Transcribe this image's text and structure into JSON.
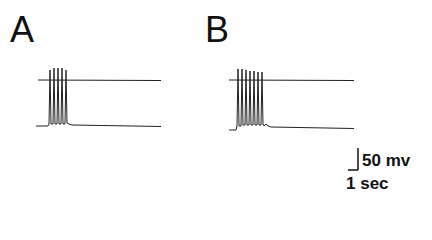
{
  "panels": [
    {
      "label": "A",
      "spike_count": 5
    },
    {
      "label": "B",
      "spike_count": 7
    }
  ],
  "scale_bar": {
    "voltage_label": "50 mv",
    "time_label": "1 sec"
  },
  "colors": {
    "trace": "#222222",
    "background": "#ffffff"
  }
}
